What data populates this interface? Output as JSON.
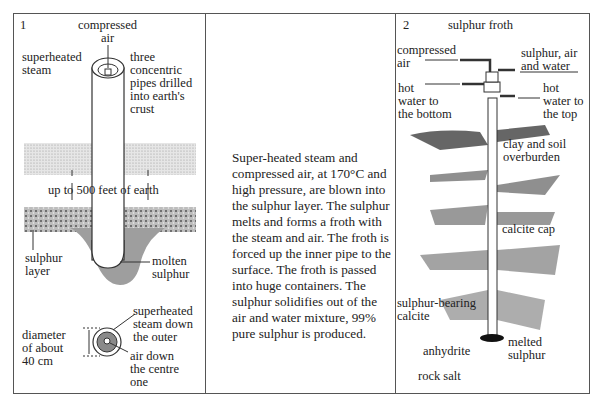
{
  "panel1": {
    "number": "1",
    "labels": {
      "compressed_air": "compressed\nair",
      "superheated_steam": "superheated\nsteam",
      "three_pipes": "three\nconcentric\npipes drilled\ninto earth's\ncrust",
      "depth": "up to 500 feet of earth",
      "sulphur_layer": "sulphur\nlayer",
      "molten_sulphur": "molten\nsulphur",
      "diameter": "diameter\nof about\n40 cm",
      "steam_outer": "superheated\nsteam down\nthe outer",
      "air_centre": "air down\nthe centre\none"
    }
  },
  "panel_text": {
    "paragraph": "Super-heated steam and compressed air, at 170°C and high pressure, are blown into the sulphur layer. The sulphur melts and forms a froth with the steam and air. The froth is forced up the inner pipe to the surface. The froth is passed into huge containers. The sulphur solidifies out of the air and water mixture, 99% pure sulphur is produced."
  },
  "panel2": {
    "number": "2",
    "title": "sulphur froth",
    "labels": {
      "compressed_air": "compressed\nair",
      "output": "sulphur, air\nand water",
      "hot_bottom": "hot\nwater to\nthe bottom",
      "hot_top": "hot\nwater to\nthe top",
      "clay": "clay and soil\noverburden",
      "calcite_cap": "calcite cap",
      "sulphur_bearing": "sulphur-bearing\ncalcite",
      "anhydrite": "anhydrite",
      "melted_sulphur": "melted\nsulphur",
      "rock_salt": "rock salt"
    }
  }
}
